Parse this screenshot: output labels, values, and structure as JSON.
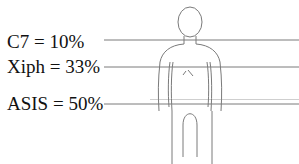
{
  "diagram": {
    "type": "anatomical-landmark-height-ratios",
    "landmarks": [
      {
        "label": "C7 = 10%",
        "name": "C7",
        "percent": 10
      },
      {
        "label": "Xiph = 33%",
        "name": "Xiph",
        "percent": 33
      },
      {
        "label": "ASIS = 50%",
        "name": "ASIS",
        "percent": 50
      }
    ],
    "colors": {
      "line": "#7a7a7a",
      "text": "#111111",
      "background": "#ffffff"
    }
  }
}
